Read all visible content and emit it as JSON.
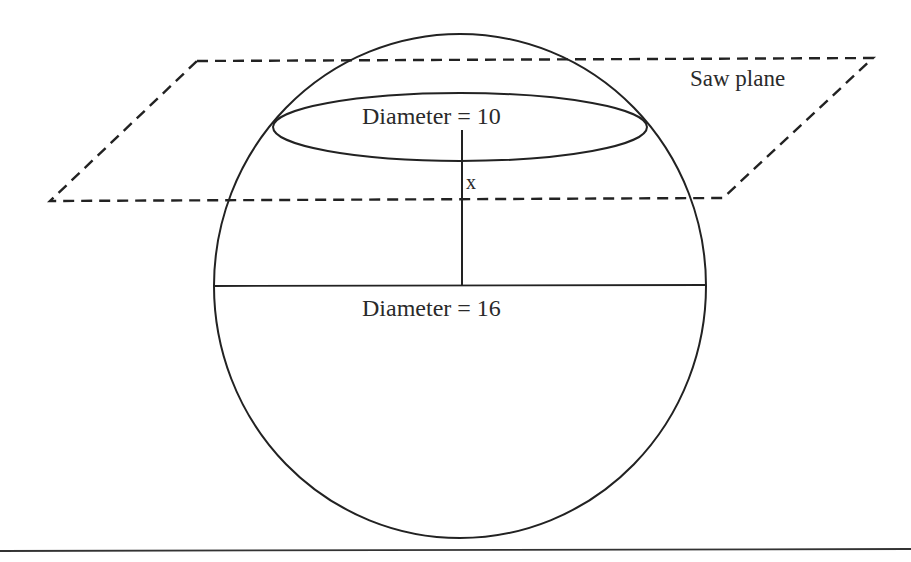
{
  "diagram": {
    "labels": {
      "saw_plane": "Saw plane",
      "small_diameter": "Diameter = 10",
      "large_diameter": "Diameter = 16",
      "distance": "x"
    },
    "colors": {
      "stroke": "#222222",
      "text": "#2a2a2a",
      "background": "#ffffff"
    }
  }
}
